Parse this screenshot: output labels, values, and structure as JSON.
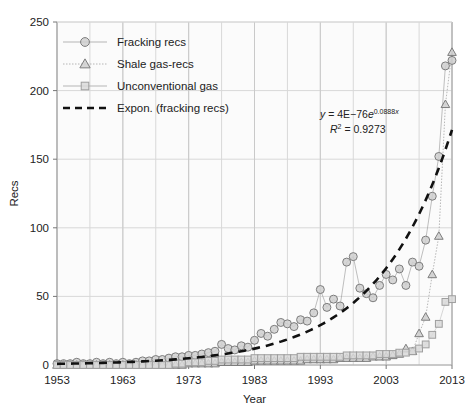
{
  "chart_data": {
    "type": "line",
    "title": "",
    "xlabel": "Year",
    "ylabel": "Recs",
    "xlim": [
      1953,
      2013
    ],
    "ylim": [
      0,
      250
    ],
    "xticks": [
      1953,
      1963,
      1973,
      1983,
      1993,
      2003,
      2013
    ],
    "yticks": [
      0,
      50,
      100,
      150,
      200,
      250
    ],
    "grid": true,
    "legend_position": "top-left",
    "annotations": [
      {
        "text": "y = 4E−76e0.0888x",
        "display": "y = 4E−76e^0.0888x"
      },
      {
        "text": "R2 = 0.9273",
        "display": "R² = 0.9273"
      }
    ],
    "x": [
      1953,
      1954,
      1955,
      1956,
      1957,
      1958,
      1959,
      1960,
      1961,
      1962,
      1963,
      1964,
      1965,
      1966,
      1967,
      1968,
      1969,
      1970,
      1971,
      1972,
      1973,
      1974,
      1975,
      1976,
      1977,
      1978,
      1979,
      1980,
      1981,
      1982,
      1983,
      1984,
      1985,
      1986,
      1987,
      1988,
      1989,
      1990,
      1991,
      1992,
      1993,
      1994,
      1995,
      1996,
      1997,
      1998,
      1999,
      2000,
      2001,
      2002,
      2003,
      2004,
      2005,
      2006,
      2007,
      2008,
      2009,
      2010,
      2011,
      2012,
      2013
    ],
    "series": [
      {
        "name": "Fracking recs",
        "marker": "circle",
        "color": "#9a9a9a",
        "values": [
          1,
          1,
          1,
          2,
          1,
          1,
          2,
          1,
          2,
          1,
          2,
          1,
          2,
          3,
          3,
          4,
          4,
          5,
          6,
          6,
          7,
          7,
          8,
          9,
          10,
          15,
          12,
          11,
          14,
          13,
          18,
          23,
          21,
          26,
          31,
          30,
          28,
          33,
          32,
          38,
          55,
          42,
          48,
          43,
          75,
          79,
          56,
          52,
          49,
          58,
          66,
          62,
          70,
          58,
          75,
          72,
          91,
          123,
          152,
          218,
          222
        ]
      },
      {
        "name": "Shale gas-recs",
        "marker": "triangle",
        "color": "#8f8f8f",
        "values": [
          0,
          0,
          0,
          0,
          0,
          0,
          0,
          0,
          0,
          0,
          0,
          0,
          0,
          0,
          0,
          0,
          0,
          0,
          0,
          0,
          1,
          1,
          1,
          1,
          1,
          2,
          2,
          2,
          2,
          2,
          3,
          3,
          3,
          3,
          3,
          3,
          3,
          3,
          4,
          4,
          4,
          4,
          4,
          5,
          5,
          5,
          5,
          5,
          6,
          6,
          6,
          7,
          8,
          12,
          10,
          23,
          35,
          66,
          94,
          190,
          228
        ]
      },
      {
        "name": "Unconventional gas",
        "marker": "square",
        "color": "#c2c2c2",
        "values": [
          0,
          0,
          0,
          0,
          0,
          0,
          0,
          0,
          0,
          0,
          0,
          0,
          0,
          0,
          0,
          0,
          0,
          0,
          1,
          1,
          2,
          2,
          2,
          3,
          3,
          4,
          4,
          4,
          4,
          4,
          5,
          5,
          5,
          5,
          5,
          5,
          5,
          6,
          6,
          6,
          6,
          6,
          6,
          6,
          7,
          7,
          7,
          7,
          7,
          8,
          8,
          8,
          9,
          9,
          10,
          12,
          15,
          22,
          30,
          46,
          48
        ]
      }
    ],
    "trendline": {
      "name": "Expon. (fracking recs)",
      "style": "dashed",
      "color": "#111111",
      "coefficient": 4e-76,
      "exponent": 0.0888
    }
  },
  "legend": {
    "items": [
      {
        "label": "Fracking recs",
        "marker": "circle"
      },
      {
        "label": "Shale gas-recs",
        "marker": "triangle"
      },
      {
        "label": "Unconventional gas",
        "marker": "square"
      },
      {
        "label": "Expon. (fracking recs)",
        "marker": "dashed-line"
      }
    ]
  },
  "colors": {
    "grid": "#d8d8d8",
    "frame": "#a8a8a8",
    "marker_fill": "#cfcfcf",
    "marker_stroke": "#7d7d7d",
    "trend": "#111111",
    "plot_bg": "#fbfbfb"
  }
}
